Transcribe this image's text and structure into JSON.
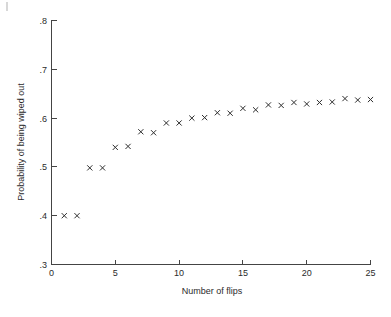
{
  "chart_data": {
    "type": "scatter",
    "title": "",
    "subtitle": "",
    "xlabel": "Number of flips",
    "ylabel": "Probability of being wiped out",
    "xlim": [
      0,
      25
    ],
    "ylim": [
      0.3,
      0.8
    ],
    "grid": false,
    "legend": null,
    "legend_position": "none",
    "marker": "x",
    "marker_color": "#2e2e2e",
    "x_ticks": [
      0,
      5,
      10,
      15,
      20,
      25
    ],
    "x_tick_labels": [
      "0",
      "5",
      "10",
      "15",
      "20",
      "25"
    ],
    "y_ticks": [
      0.3,
      0.4,
      0.5,
      0.6,
      0.7,
      0.8
    ],
    "y_tick_labels": [
      ".3",
      ".4",
      ".5",
      ".6",
      ".7",
      ".8"
    ],
    "x": [
      1,
      2,
      3,
      4,
      5,
      6,
      7,
      8,
      9,
      10,
      11,
      12,
      13,
      14,
      15,
      16,
      17,
      18,
      19,
      20,
      21,
      22,
      23,
      24,
      25
    ],
    "values": [
      0.4,
      0.4,
      0.498,
      0.498,
      0.54,
      0.542,
      0.572,
      0.57,
      0.59,
      0.59,
      0.6,
      0.601,
      0.611,
      0.61,
      0.62,
      0.617,
      0.627,
      0.626,
      0.632,
      0.629,
      0.632,
      0.633,
      0.64,
      0.637,
      0.638
    ],
    "series": [
      {
        "name": "Probability of being wiped out",
        "x": [
          1,
          2,
          3,
          4,
          5,
          6,
          7,
          8,
          9,
          10,
          11,
          12,
          13,
          14,
          15,
          16,
          17,
          18,
          19,
          20,
          21,
          22,
          23,
          24,
          25
        ],
        "values": [
          0.4,
          0.4,
          0.498,
          0.498,
          0.54,
          0.542,
          0.572,
          0.57,
          0.59,
          0.59,
          0.6,
          0.601,
          0.611,
          0.61,
          0.62,
          0.617,
          0.627,
          0.626,
          0.632,
          0.629,
          0.632,
          0.633,
          0.64,
          0.637,
          0.638
        ]
      }
    ],
    "annotations": []
  },
  "figure": {
    "background_color": "#ffffff",
    "axis_color": "#444444",
    "text_color": "#2b2b2b"
  }
}
